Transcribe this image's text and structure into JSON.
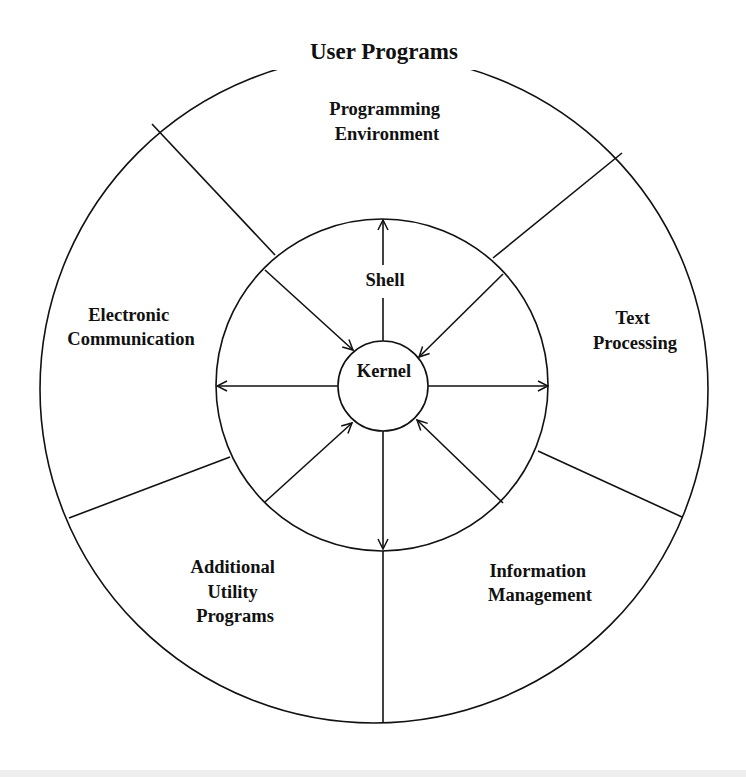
{
  "diagram": {
    "title": "User Programs",
    "center": {
      "label": "Kernel"
    },
    "middle_ring": {
      "label": "Shell"
    },
    "outer_segments": [
      {
        "id": "programming-environment",
        "lines": [
          "Programming",
          "Environment"
        ]
      },
      {
        "id": "text-processing",
        "lines": [
          "Text",
          "Processing"
        ]
      },
      {
        "id": "information-management",
        "lines": [
          "Information",
          "Management"
        ]
      },
      {
        "id": "additional-utility-programs",
        "lines": [
          "Additional",
          "Utility",
          "Programs"
        ]
      },
      {
        "id": "electronic-communication",
        "lines": [
          "Electronic",
          "Communication"
        ]
      }
    ],
    "arrows": [
      {
        "from": "Kernel",
        "to": "Shell-outer-edge",
        "direction": "up"
      },
      {
        "from": "Kernel",
        "to": "Shell-outer-edge",
        "direction": "left"
      },
      {
        "from": "Kernel",
        "to": "Shell-outer-edge",
        "direction": "right"
      },
      {
        "from": "Kernel",
        "to": "Shell-outer-edge",
        "direction": "down"
      },
      {
        "from": "Shell-outer-edge",
        "to": "Kernel",
        "direction": "upper-left-inward"
      },
      {
        "from": "Shell-outer-edge",
        "to": "Kernel",
        "direction": "upper-right-inward"
      },
      {
        "from": "Shell-outer-edge",
        "to": "Kernel",
        "direction": "lower-left-inward"
      },
      {
        "from": "Shell-outer-edge",
        "to": "Kernel",
        "direction": "lower-right-inward"
      }
    ],
    "colors": {
      "line": "#111111",
      "background": "#ffffff"
    }
  }
}
